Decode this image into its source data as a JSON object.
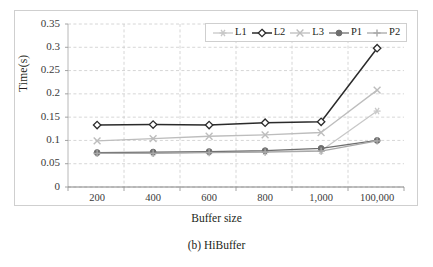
{
  "figure": {
    "caption": "(b) HiBuffer"
  },
  "chart_data": {
    "type": "line",
    "title": "",
    "xlabel": "Buffer size",
    "ylabel": "Time(s)",
    "categories": [
      "200",
      "400",
      "600",
      "800",
      "1,000",
      "100,000"
    ],
    "ylim": [
      0,
      0.35
    ],
    "ytick_values": [
      0,
      0.05,
      0.1,
      0.15,
      0.2,
      0.25,
      0.3,
      0.35
    ],
    "ytick_labels": [
      "0",
      "0.05",
      "0.1",
      "0.15",
      "0.2",
      "0.25",
      "0.3",
      "0.35"
    ],
    "grid": true,
    "legend_position": "top-right",
    "series": [
      {
        "name": "L1",
        "marker": "asterisk-marker",
        "color": "#c8c8c8",
        "values": [
          0.073,
          0.073,
          0.075,
          0.076,
          0.078,
          0.163
        ]
      },
      {
        "name": "L2",
        "marker": "diamond-marker",
        "color": "#2b2b2b",
        "values": [
          0.133,
          0.134,
          0.133,
          0.138,
          0.14,
          0.298
        ]
      },
      {
        "name": "L3",
        "marker": "x-marker",
        "color": "#bdbdbd",
        "values": [
          0.099,
          0.104,
          0.109,
          0.112,
          0.117,
          0.208
        ]
      },
      {
        "name": "P1",
        "marker": "circle-marker",
        "color": "#6e6e6e",
        "values": [
          0.074,
          0.075,
          0.076,
          0.078,
          0.083,
          0.1
        ]
      },
      {
        "name": "P2",
        "marker": "plus-marker",
        "color": "#a8a8a8",
        "values": [
          0.072,
          0.072,
          0.074,
          0.075,
          0.077,
          0.099
        ]
      }
    ]
  }
}
